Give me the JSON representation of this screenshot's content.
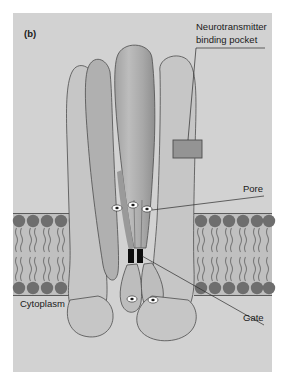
{
  "figure": {
    "panel_label": "(b)",
    "background_color": "#ffffff",
    "panel_color": "#d2d2d2"
  },
  "annotations": {
    "binding_pocket": {
      "line1": "Neurotransmitter",
      "line2": "binding pocket"
    },
    "pore": "Pore",
    "gate": "Gate",
    "cytoplasm": "Cytoplasm"
  },
  "structure": {
    "protein_fill": "#c6c6c6",
    "protein_fill_dark": "#a8a8a8",
    "protein_fill_mid": "#b6b6b6",
    "protein_stroke": "#4d4d4d",
    "pocket_fill": "#949494",
    "pocket_stroke": "#4d4d4d",
    "gate_fill": "#0d0d0d",
    "ion_fill": "#ffffff",
    "ion_core": "#1a1a1a"
  },
  "membrane": {
    "band_fill": "#c0c0c0",
    "head_fill": "#6e6e6e",
    "tail_stroke": "#7a7a7a",
    "edge_stroke": "#5a5a5a",
    "head_count_left": 5,
    "head_count_right": 6,
    "top_y": 213,
    "bottom_y": 296
  },
  "ions": {
    "pore_count": 3,
    "cytoplasm_count": 2
  }
}
